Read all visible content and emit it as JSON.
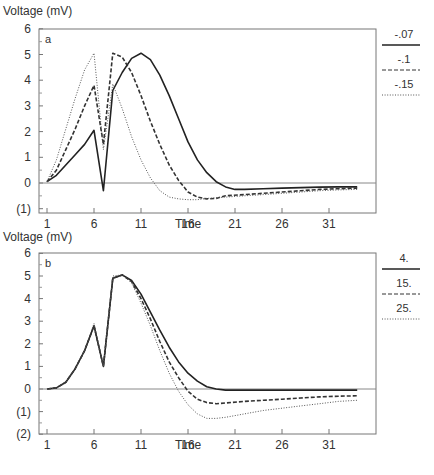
{
  "chart_data": [
    {
      "panel": "a",
      "type": "line",
      "title": "",
      "panel_label": "a",
      "ylabel": "Voltage (mV)",
      "xlabel": "Time",
      "ylim": [
        -1,
        6
      ],
      "xlim": [
        0,
        35
      ],
      "yticks": [
        -1,
        0,
        1,
        2,
        3,
        4,
        5,
        6
      ],
      "ytick_labels": [
        "(1)",
        "0",
        "1",
        "2",
        "3",
        "4",
        "5",
        "6"
      ],
      "xticks": [
        1,
        6,
        11,
        16,
        21,
        26,
        31
      ],
      "xtick_labels": [
        "1",
        "6",
        "11",
        "16",
        "21",
        "26",
        "31"
      ],
      "grid": false,
      "legend_position": "right",
      "reference_line_y": 0,
      "series": [
        {
          "name": "-.07",
          "style": "solid",
          "x": [
            1,
            2,
            3,
            4,
            5,
            6,
            7,
            8,
            9,
            10,
            11,
            12,
            13,
            14,
            15,
            16,
            17,
            18,
            19,
            20,
            21,
            22,
            24,
            26,
            28,
            30,
            32,
            34
          ],
          "y": [
            0.05,
            0.3,
            0.7,
            1.1,
            1.5,
            2.05,
            -0.3,
            3.6,
            4.3,
            4.85,
            5.05,
            4.8,
            4.2,
            3.4,
            2.5,
            1.6,
            0.9,
            0.4,
            0.05,
            -0.15,
            -0.25,
            -0.25,
            -0.22,
            -0.2,
            -0.18,
            -0.16,
            -0.15,
            -0.15
          ]
        },
        {
          "name": "-.1",
          "style": "dashed",
          "x": [
            1,
            2,
            3,
            4,
            5,
            6,
            7,
            8,
            9,
            10,
            11,
            12,
            13,
            14,
            15,
            16,
            17,
            18,
            19,
            20,
            22,
            24,
            26,
            28,
            30,
            32,
            34
          ],
          "y": [
            0.05,
            0.5,
            1.3,
            2.1,
            3.0,
            3.8,
            1.5,
            5.05,
            4.9,
            4.3,
            3.4,
            2.4,
            1.5,
            0.7,
            0.1,
            -0.35,
            -0.55,
            -0.62,
            -0.6,
            -0.5,
            -0.45,
            -0.4,
            -0.35,
            -0.3,
            -0.25,
            -0.22,
            -0.2
          ]
        },
        {
          "name": "-.15",
          "style": "dotted",
          "x": [
            1,
            2,
            3,
            4,
            5,
            6,
            7,
            8,
            9,
            10,
            11,
            12,
            13,
            14,
            15,
            16,
            17,
            18,
            20,
            22,
            24,
            26,
            28,
            30,
            32,
            34
          ],
          "y": [
            0.05,
            0.9,
            2.1,
            3.3,
            4.4,
            5.05,
            1.3,
            3.85,
            2.9,
            1.8,
            0.9,
            0.2,
            -0.3,
            -0.55,
            -0.62,
            -0.65,
            -0.65,
            -0.6,
            -0.55,
            -0.5,
            -0.45,
            -0.4,
            -0.35,
            -0.3,
            -0.27,
            -0.25
          ]
        }
      ]
    },
    {
      "panel": "b",
      "type": "line",
      "title": "",
      "panel_label": "b",
      "ylabel": "Voltage (mV)",
      "xlabel": "Time",
      "ylim": [
        -2,
        6
      ],
      "xlim": [
        0,
        35
      ],
      "yticks": [
        -2,
        -1,
        0,
        1,
        2,
        3,
        4,
        5,
        6
      ],
      "ytick_labels": [
        "(2)",
        "(1)",
        "0",
        "1",
        "2",
        "3",
        "4",
        "5",
        "6"
      ],
      "xticks": [
        1,
        6,
        11,
        16,
        21,
        26,
        31
      ],
      "xtick_labels": [
        "1",
        "6",
        "11",
        "16",
        "21",
        "26",
        "31"
      ],
      "grid": false,
      "legend_position": "right",
      "reference_line_y": 0,
      "series": [
        {
          "name": "4.",
          "style": "solid",
          "x": [
            1,
            2,
            3,
            4,
            5,
            6,
            7,
            8,
            9,
            10,
            11,
            12,
            13,
            14,
            15,
            16,
            17,
            18,
            19,
            20,
            22,
            24,
            26,
            28,
            30,
            32,
            34
          ],
          "y": [
            0.0,
            0.05,
            0.3,
            0.9,
            1.7,
            2.8,
            1.0,
            4.9,
            5.05,
            4.8,
            4.2,
            3.4,
            2.6,
            1.85,
            1.2,
            0.7,
            0.35,
            0.1,
            0.0,
            -0.05,
            -0.05,
            -0.05,
            -0.05,
            -0.05,
            -0.05,
            -0.05,
            -0.05
          ]
        },
        {
          "name": "15.",
          "style": "dashed",
          "x": [
            1,
            2,
            3,
            4,
            5,
            6,
            7,
            8,
            9,
            10,
            11,
            12,
            13,
            14,
            15,
            16,
            17,
            18,
            19,
            20,
            22,
            24,
            26,
            28,
            30,
            32,
            34
          ],
          "y": [
            0.0,
            0.05,
            0.3,
            0.9,
            1.7,
            2.8,
            1.0,
            4.9,
            5.05,
            4.75,
            4.0,
            3.1,
            2.1,
            1.2,
            0.5,
            -0.1,
            -0.45,
            -0.6,
            -0.65,
            -0.62,
            -0.55,
            -0.5,
            -0.45,
            -0.4,
            -0.35,
            -0.32,
            -0.3
          ]
        },
        {
          "name": "25.",
          "style": "dotted",
          "x": [
            1,
            2,
            3,
            4,
            5,
            6,
            7,
            8,
            9,
            10,
            11,
            12,
            13,
            14,
            15,
            16,
            17,
            18,
            19,
            20,
            22,
            24,
            26,
            28,
            30,
            32,
            34
          ],
          "y": [
            0.0,
            0.05,
            0.3,
            0.9,
            1.7,
            2.9,
            1.0,
            5.0,
            5.05,
            4.7,
            3.8,
            2.8,
            1.7,
            0.7,
            -0.1,
            -0.7,
            -1.1,
            -1.3,
            -1.3,
            -1.25,
            -1.1,
            -0.95,
            -0.85,
            -0.75,
            -0.65,
            -0.55,
            -0.5
          ]
        }
      ]
    }
  ],
  "figure_caption_partial": "Fig. 12.5"
}
